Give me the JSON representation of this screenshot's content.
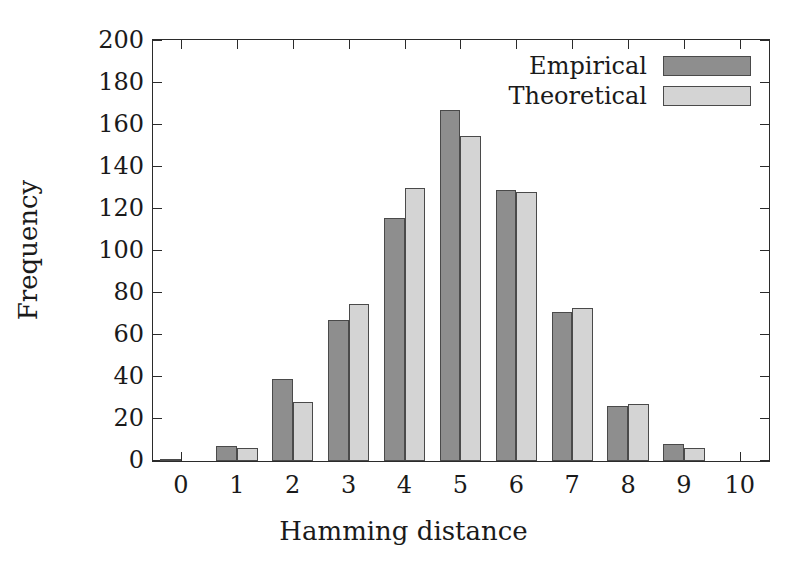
{
  "chart_data": {
    "type": "bar",
    "title": "",
    "xlabel": "Hamming distance",
    "ylabel": "Frequency",
    "categories": [
      "0",
      "1",
      "2",
      "3",
      "4",
      "5",
      "6",
      "7",
      "8",
      "9",
      "10"
    ],
    "series": [
      {
        "name": "Empirical",
        "color": "#8e8e8e",
        "values": [
          1,
          7,
          39,
          67,
          116,
          167,
          129,
          71,
          26,
          8,
          0
        ]
      },
      {
        "name": "Theoretical",
        "color": "#d4d4d4",
        "values": [
          0,
          6,
          28,
          75,
          130,
          155,
          128,
          73,
          27,
          6,
          0
        ]
      }
    ],
    "ylim": [
      0,
      200
    ],
    "ytick_labels": [
      "0",
      "20",
      "40",
      "60",
      "80",
      "100",
      "120",
      "140",
      "160",
      "180",
      "200"
    ],
    "ytick_values": [
      0,
      20,
      40,
      60,
      80,
      100,
      120,
      140,
      160,
      180,
      200
    ],
    "xlim": [
      -0.5,
      10.5
    ],
    "grid": false,
    "legend_position": "top-right",
    "legend_entries": [
      "Empirical",
      "Theoretical"
    ],
    "axis_color": "#2b2b2b",
    "bar_edge_color": "#4a4a4a",
    "background": "#ffffff"
  }
}
